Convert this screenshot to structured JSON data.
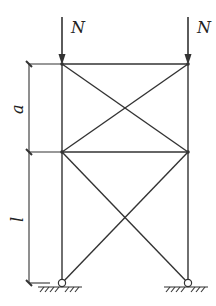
{
  "diagram": {
    "type": "braced-frame",
    "loads": [
      {
        "label": "N",
        "direction": "down",
        "at": "top-left-node"
      },
      {
        "label": "N",
        "direction": "down",
        "at": "top-right-node"
      }
    ],
    "dimensions": [
      {
        "label": "a",
        "span": "top panel height"
      },
      {
        "label": "l",
        "span": "bottom panel height"
      }
    ],
    "panels": 2,
    "bracing": "X-bracing in each panel",
    "supports": [
      {
        "type": "pin",
        "at": "bottom-left"
      },
      {
        "type": "pin",
        "at": "bottom-right"
      }
    ],
    "colors": {
      "line": "#333333",
      "background": "#ffffff"
    }
  },
  "labels": {
    "load_left": "N",
    "load_right": "N",
    "dim_top": "a",
    "dim_bottom": "l"
  }
}
